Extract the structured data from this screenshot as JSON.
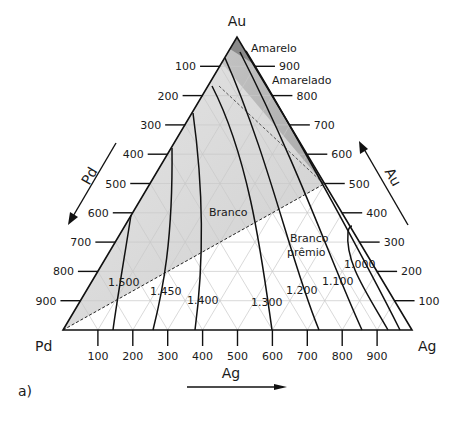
{
  "diagram": {
    "type": "ternary",
    "vertices": {
      "top": "Au",
      "left": "Pd",
      "right": "Ag"
    },
    "panel_label": "a)",
    "axis_arrows": {
      "left": "Pd",
      "right": "Au",
      "bottom": "Ag"
    },
    "ticks": {
      "left": [
        "100",
        "200",
        "300",
        "400",
        "500",
        "600",
        "700",
        "800",
        "900"
      ],
      "right": [
        "900",
        "800",
        "700",
        "600",
        "500",
        "400",
        "300",
        "200",
        "100"
      ],
      "bottom": [
        "100",
        "200",
        "300",
        "400",
        "500",
        "600",
        "700",
        "800",
        "900"
      ]
    },
    "regions": [
      {
        "label": "Amarelo",
        "color": "#8c8c8c"
      },
      {
        "label": "Amarelado",
        "color": "#b5b5b5"
      },
      {
        "label": "Branco",
        "color": "#d8d8d8"
      },
      {
        "label_line1": "Branco",
        "label_line2": "prêmio",
        "color": "#ffffff"
      }
    ],
    "isotherms": [
      "1.500",
      "1.450",
      "1.400",
      "1.300",
      "1.200",
      "1.100",
      "1.000"
    ]
  }
}
